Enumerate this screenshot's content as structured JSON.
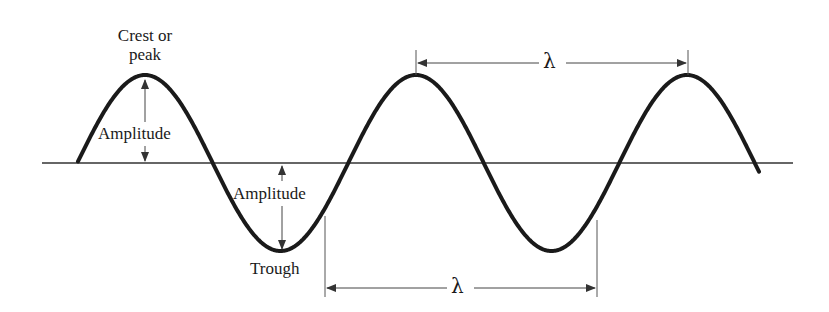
{
  "diagram": {
    "labels": {
      "crest": "Crest or\npeak",
      "crest_line1": "Crest or",
      "crest_line2": "peak",
      "amplitude_top": "Amplitude",
      "amplitude_bottom": "Amplitude",
      "trough": "Trough",
      "wavelength_top": "λ",
      "wavelength_bottom": "λ"
    },
    "geometry": {
      "baseline_y": 163,
      "baseline_x_start": 42,
      "baseline_x_end": 793,
      "wave_x_start": 78,
      "wave_x_end": 759,
      "amplitude_px": 88,
      "period_px": 271,
      "crests_x": [
        145,
        416,
        688
      ],
      "troughs_x": [
        282,
        552
      ],
      "wavelength_top_span": [
        416,
        688
      ],
      "wavelength_bottom_span": [
        325,
        597
      ]
    },
    "colors": {
      "wave": "#1a1a1a",
      "baseline": "#333333",
      "annotation": "#444444",
      "background": "#ffffff"
    }
  }
}
